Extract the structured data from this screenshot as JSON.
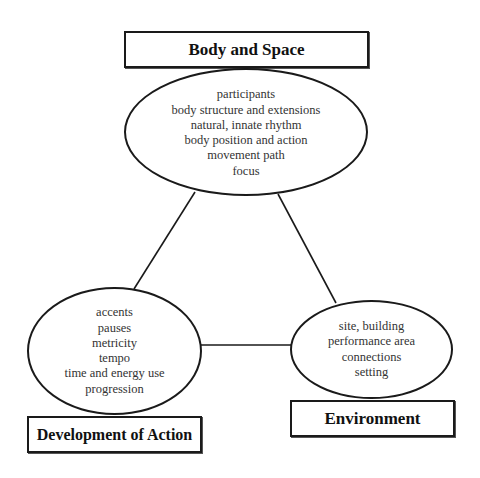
{
  "diagram": {
    "type": "triangle-concept-map",
    "nodes": {
      "body_space": {
        "title": "Body and Space",
        "items": [
          "participants",
          "body structure and extensions",
          "natural, innate rhythm",
          "body position and action",
          "movement path",
          "focus"
        ]
      },
      "development": {
        "title": "Development of Action",
        "items": [
          "accents",
          "pauses",
          "metricity",
          "tempo",
          "time and energy use",
          "progression"
        ]
      },
      "environment": {
        "title": "Environment",
        "items": [
          "site, building",
          "performance area",
          "connections",
          "setting"
        ]
      }
    },
    "edges": [
      {
        "from": "body_space",
        "to": "development"
      },
      {
        "from": "body_space",
        "to": "environment"
      },
      {
        "from": "development",
        "to": "environment"
      }
    ],
    "colors": {
      "stroke": "#1a1a1a",
      "text": "#333333",
      "background": "#ffffff"
    }
  }
}
